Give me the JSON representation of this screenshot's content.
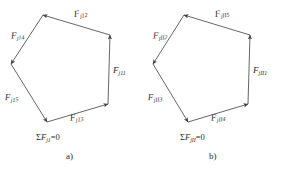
{
  "figure": {
    "type": "force-polygon-diagram",
    "stroke_color": "#4a4a4a",
    "text_color": "#2b2b2b",
    "background": "#ffffff",
    "panels": [
      {
        "id": "a",
        "caption": "a)",
        "sum_label": {
          "sigma": "Σ",
          "symbol": "F",
          "subscript": "j1",
          "equals": "=0",
          "full": "ΣFj1=0"
        },
        "vectors": [
          {
            "name": "Fj11",
            "symbol": "F",
            "subscript": "j11"
          },
          {
            "name": "Fj12",
            "symbol": "F",
            "subscript": "j12"
          },
          {
            "name": "Fj13",
            "symbol": "F",
            "subscript": "j13"
          },
          {
            "name": "Fj14",
            "symbol": "F",
            "subscript": "j14"
          },
          {
            "name": "Fj15",
            "symbol": "F",
            "subscript": "j15"
          }
        ]
      },
      {
        "id": "b",
        "caption": "b)",
        "sum_label": {
          "sigma": "Σ",
          "symbol": "F",
          "subscript": "jII",
          "equals": "=0",
          "full": "ΣFjII=0"
        },
        "vectors": [
          {
            "name": "FjII1",
            "symbol": "F",
            "subscript": "jII1"
          },
          {
            "name": "FjII2",
            "symbol": "F",
            "subscript": "jII2"
          },
          {
            "name": "FjII3",
            "symbol": "F",
            "subscript": "jII3"
          },
          {
            "name": "FjII4",
            "symbol": "F",
            "subscript": "jII4"
          },
          {
            "name": "FjII5",
            "symbol": "F",
            "subscript": "jII5"
          }
        ]
      }
    ]
  }
}
